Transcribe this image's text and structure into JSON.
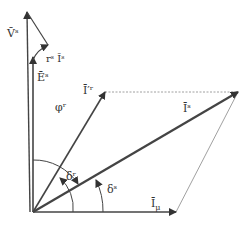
{
  "diagram": {
    "type": "phasor diagram",
    "labels": {
      "Vs": "V̄ˢ",
      "rsIs": "rˢ Īˢ",
      "Es": "Ēˢ",
      "Ir": "Ī′ʳ",
      "phi": "φʳ",
      "Is": "Īˢ",
      "deltar": "δʳ",
      "deltas": "δˢ",
      "Imu": "Ī",
      "Imu_sub": "μ"
    },
    "colors": {
      "line": "#444444",
      "dotted": "#888888"
    }
  }
}
